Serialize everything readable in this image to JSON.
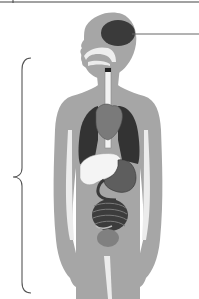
{
  "diagram": {
    "type": "human-body-anatomy",
    "labels": [],
    "regions": [
      {
        "name": "brain",
        "shade": "dark"
      },
      {
        "name": "nasal-cavity",
        "shade": "light"
      },
      {
        "name": "esophagus",
        "shade": "light"
      },
      {
        "name": "heart",
        "shade": "medium"
      },
      {
        "name": "left-lung",
        "shade": "dark"
      },
      {
        "name": "right-lung",
        "shade": "dark"
      },
      {
        "name": "liver",
        "shade": "light"
      },
      {
        "name": "stomach",
        "shade": "medium-dark"
      },
      {
        "name": "intestines",
        "shade": "dark"
      },
      {
        "name": "bladder",
        "shade": "medium"
      }
    ],
    "annotations": {
      "brain_pointer_line": true,
      "torso_brace": true
    }
  },
  "colors": {
    "body": "#a6a6a6",
    "body_light": "#ececec",
    "brain": "#3a3a3a",
    "lungs": "#333333",
    "heart": "#7a7a7a",
    "liver": "#f4f4f4",
    "stomach": "#5e5e5e",
    "intestines": "#3c3c3c",
    "bladder": "#808080",
    "line": "#555555"
  }
}
